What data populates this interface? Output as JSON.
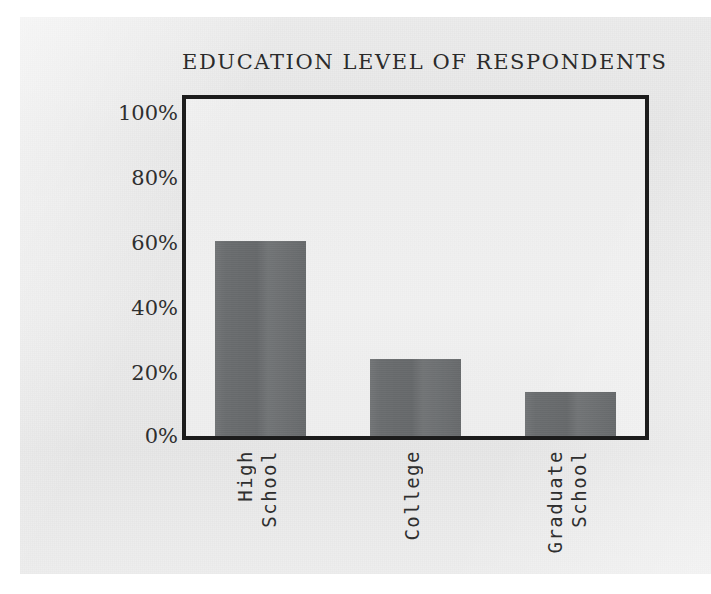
{
  "chart_data": {
    "type": "bar",
    "title": "EDUCATION LEVEL OF RESPONDENTS",
    "xlabel": "",
    "ylabel": "",
    "categories": [
      "High School",
      "College",
      "Graduate School"
    ],
    "category_lines": [
      [
        "High",
        "School"
      ],
      [
        "College"
      ],
      [
        "Graduate",
        "School"
      ]
    ],
    "values": [
      58,
      23,
      13
    ],
    "ylim": [
      0,
      100
    ],
    "ytick_values": [
      0,
      20,
      40,
      60,
      80,
      100
    ],
    "ytick_labels": [
      "0%",
      "20%",
      "40%",
      "60%",
      "80%",
      "100%"
    ],
    "grid": false,
    "legend": "none",
    "bar_color": "#6a6d6f",
    "frame_color": "#1c1c1c",
    "text_color": "#2f2f2f",
    "background_color": "#e7e7e7"
  }
}
